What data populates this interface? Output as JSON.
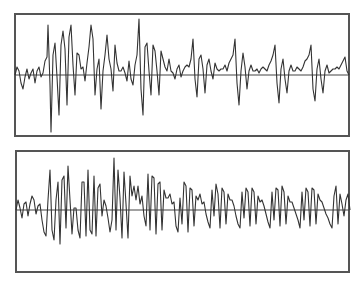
{
  "chart_data": [
    {
      "type": "line",
      "title": "",
      "xlabel": "",
      "ylabel": "",
      "grid": false,
      "legend": null,
      "description": "Waveform trace (top panel) with horizontal zero baseline; large bursts early that decay, recurring smaller bursts toward the right",
      "frame": {
        "x": 14,
        "y": 13,
        "w": 336,
        "h": 124
      },
      "baseline_y": 75,
      "ylim": [
        -62,
        62
      ],
      "line_color": "#333333",
      "points_dx_dy": [
        [
          0,
          0
        ],
        [
          2,
          -8
        ],
        [
          4,
          -4
        ],
        [
          6,
          8
        ],
        [
          8,
          14
        ],
        [
          10,
          2
        ],
        [
          12,
          -6
        ],
        [
          14,
          4
        ],
        [
          16,
          -2
        ],
        [
          18,
          -6
        ],
        [
          20,
          8
        ],
        [
          22,
          -4
        ],
        [
          24,
          -8
        ],
        [
          26,
          2
        ],
        [
          28,
          -2
        ],
        [
          30,
          -14
        ],
        [
          32,
          -18
        ],
        [
          33,
          -50
        ],
        [
          35,
          10
        ],
        [
          36,
          57
        ],
        [
          38,
          -20
        ],
        [
          40,
          -32
        ],
        [
          42,
          2
        ],
        [
          44,
          40
        ],
        [
          46,
          -30
        ],
        [
          48,
          -44
        ],
        [
          50,
          -26
        ],
        [
          52,
          30
        ],
        [
          54,
          -38
        ],
        [
          56,
          -50
        ],
        [
          58,
          -10
        ],
        [
          60,
          20
        ],
        [
          62,
          -22
        ],
        [
          64,
          -20
        ],
        [
          66,
          -6
        ],
        [
          68,
          -8
        ],
        [
          70,
          6
        ],
        [
          72,
          -12
        ],
        [
          74,
          -28
        ],
        [
          76,
          -50
        ],
        [
          78,
          -36
        ],
        [
          80,
          20
        ],
        [
          82,
          -6
        ],
        [
          84,
          -16
        ],
        [
          86,
          34
        ],
        [
          88,
          -4
        ],
        [
          90,
          -20
        ],
        [
          92,
          -40
        ],
        [
          94,
          -16
        ],
        [
          96,
          -6
        ],
        [
          98,
          16
        ],
        [
          100,
          -30
        ],
        [
          102,
          -12
        ],
        [
          104,
          -4
        ],
        [
          106,
          -4
        ],
        [
          108,
          -8
        ],
        [
          110,
          -2
        ],
        [
          112,
          6
        ],
        [
          114,
          -14
        ],
        [
          116,
          4
        ],
        [
          118,
          10
        ],
        [
          120,
          -10
        ],
        [
          122,
          -20
        ],
        [
          124,
          -56
        ],
        [
          126,
          14
        ],
        [
          128,
          40
        ],
        [
          130,
          -28
        ],
        [
          132,
          -32
        ],
        [
          134,
          -4
        ],
        [
          136,
          20
        ],
        [
          138,
          -30
        ],
        [
          140,
          -24
        ],
        [
          142,
          -4
        ],
        [
          144,
          20
        ],
        [
          146,
          -24
        ],
        [
          148,
          -16
        ],
        [
          150,
          -8
        ],
        [
          152,
          -4
        ],
        [
          154,
          -16
        ],
        [
          156,
          -4
        ],
        [
          158,
          -2
        ],
        [
          160,
          4
        ],
        [
          162,
          -6
        ],
        [
          164,
          -10
        ],
        [
          166,
          2
        ],
        [
          168,
          -4
        ],
        [
          170,
          -8
        ],
        [
          172,
          -10
        ],
        [
          174,
          -8
        ],
        [
          176,
          -16
        ],
        [
          178,
          -36
        ],
        [
          180,
          4
        ],
        [
          182,
          22
        ],
        [
          184,
          -16
        ],
        [
          186,
          -20
        ],
        [
          188,
          -6
        ],
        [
          190,
          18
        ],
        [
          192,
          -10
        ],
        [
          194,
          -16
        ],
        [
          196,
          -4
        ],
        [
          198,
          4
        ],
        [
          200,
          -12
        ],
        [
          202,
          -6
        ],
        [
          204,
          -4
        ],
        [
          206,
          -6
        ],
        [
          208,
          -6
        ],
        [
          210,
          -10
        ],
        [
          212,
          -4
        ],
        [
          214,
          -12
        ],
        [
          216,
          -16
        ],
        [
          218,
          -20
        ],
        [
          220,
          -36
        ],
        [
          222,
          8
        ],
        [
          224,
          30
        ],
        [
          226,
          -4
        ],
        [
          228,
          -22
        ],
        [
          230,
          -8
        ],
        [
          232,
          14
        ],
        [
          234,
          -4
        ],
        [
          236,
          -10
        ],
        [
          238,
          -4
        ],
        [
          240,
          -4
        ],
        [
          242,
          -6
        ],
        [
          244,
          -2
        ],
        [
          246,
          -6
        ],
        [
          248,
          -8
        ],
        [
          250,
          -6
        ],
        [
          252,
          -4
        ],
        [
          254,
          -10
        ],
        [
          256,
          -14
        ],
        [
          258,
          -20
        ],
        [
          260,
          -30
        ],
        [
          262,
          8
        ],
        [
          264,
          28
        ],
        [
          266,
          -6
        ],
        [
          268,
          -16
        ],
        [
          270,
          4
        ],
        [
          272,
          18
        ],
        [
          274,
          -4
        ],
        [
          276,
          -10
        ],
        [
          278,
          -4
        ],
        [
          280,
          -4
        ],
        [
          282,
          -8
        ],
        [
          284,
          -6
        ],
        [
          286,
          -4
        ],
        [
          288,
          -8
        ],
        [
          290,
          -14
        ],
        [
          292,
          -16
        ],
        [
          294,
          -20
        ],
        [
          296,
          -30
        ],
        [
          298,
          14
        ],
        [
          300,
          26
        ],
        [
          302,
          -6
        ],
        [
          304,
          -16
        ],
        [
          306,
          4
        ],
        [
          308,
          18
        ],
        [
          310,
          -4
        ],
        [
          312,
          -10
        ],
        [
          314,
          -2
        ],
        [
          316,
          -4
        ],
        [
          318,
          -6
        ],
        [
          320,
          -6
        ],
        [
          322,
          -8
        ],
        [
          324,
          -6
        ],
        [
          326,
          -10
        ],
        [
          328,
          -14
        ],
        [
          330,
          -18
        ],
        [
          332,
          -4
        ],
        [
          334,
          0
        ]
      ]
    },
    {
      "type": "line",
      "title": "",
      "xlabel": "",
      "ylabel": "",
      "grid": false,
      "legend": null,
      "description": "Waveform trace (bottom panel) with horizontal zero baseline; dense periodic bursts with asymmetric (mostly positive) peaks and rounded negative troughs",
      "frame": {
        "x": 15,
        "y": 150,
        "w": 335,
        "h": 123
      },
      "baseline_y": 210,
      "ylim": [
        -60,
        60
      ],
      "line_color": "#333333",
      "points_dx_dy": [
        [
          0,
          0
        ],
        [
          2,
          -10
        ],
        [
          4,
          -2
        ],
        [
          6,
          8
        ],
        [
          8,
          -6
        ],
        [
          10,
          -8
        ],
        [
          12,
          6
        ],
        [
          14,
          -6
        ],
        [
          16,
          -14
        ],
        [
          18,
          -10
        ],
        [
          20,
          4
        ],
        [
          22,
          -4
        ],
        [
          24,
          -6
        ],
        [
          26,
          10
        ],
        [
          28,
          22
        ],
        [
          30,
          26
        ],
        [
          32,
          -10
        ],
        [
          34,
          -40
        ],
        [
          36,
          20
        ],
        [
          38,
          30
        ],
        [
          40,
          -10
        ],
        [
          42,
          -28
        ],
        [
          44,
          34
        ],
        [
          46,
          -30
        ],
        [
          48,
          -34
        ],
        [
          50,
          18
        ],
        [
          52,
          -44
        ],
        [
          54,
          -10
        ],
        [
          56,
          24
        ],
        [
          58,
          -2
        ],
        [
          60,
          -2
        ],
        [
          62,
          20
        ],
        [
          64,
          28
        ],
        [
          66,
          -28
        ],
        [
          68,
          -28
        ],
        [
          70,
          26
        ],
        [
          72,
          -40
        ],
        [
          74,
          20
        ],
        [
          76,
          24
        ],
        [
          78,
          -34
        ],
        [
          80,
          26
        ],
        [
          82,
          -22
        ],
        [
          84,
          -26
        ],
        [
          86,
          6
        ],
        [
          88,
          -10
        ],
        [
          90,
          -4
        ],
        [
          92,
          8
        ],
        [
          94,
          22
        ],
        [
          96,
          10
        ],
        [
          98,
          -52
        ],
        [
          100,
          20
        ],
        [
          102,
          -40
        ],
        [
          104,
          -12
        ],
        [
          106,
          28
        ],
        [
          108,
          -38
        ],
        [
          110,
          -6
        ],
        [
          112,
          28
        ],
        [
          114,
          -34
        ],
        [
          116,
          -14
        ],
        [
          118,
          -24
        ],
        [
          120,
          -10
        ],
        [
          122,
          -24
        ],
        [
          124,
          -6
        ],
        [
          126,
          -14
        ],
        [
          128,
          6
        ],
        [
          130,
          16
        ],
        [
          132,
          -36
        ],
        [
          134,
          20
        ],
        [
          136,
          -34
        ],
        [
          138,
          -32
        ],
        [
          140,
          24
        ],
        [
          142,
          -26
        ],
        [
          144,
          -28
        ],
        [
          146,
          20
        ],
        [
          148,
          -20
        ],
        [
          150,
          -12
        ],
        [
          152,
          -12
        ],
        [
          154,
          -16
        ],
        [
          156,
          -6
        ],
        [
          158,
          -8
        ],
        [
          160,
          16
        ],
        [
          162,
          22
        ],
        [
          164,
          -12
        ],
        [
          166,
          14
        ],
        [
          168,
          -28
        ],
        [
          170,
          -24
        ],
        [
          172,
          22
        ],
        [
          174,
          -22
        ],
        [
          176,
          -20
        ],
        [
          178,
          16
        ],
        [
          180,
          -14
        ],
        [
          182,
          -10
        ],
        [
          184,
          -16
        ],
        [
          186,
          -6
        ],
        [
          188,
          -8
        ],
        [
          190,
          4
        ],
        [
          192,
          12
        ],
        [
          194,
          18
        ],
        [
          196,
          -20
        ],
        [
          198,
          6
        ],
        [
          200,
          -26
        ],
        [
          202,
          -16
        ],
        [
          204,
          18
        ],
        [
          206,
          -22
        ],
        [
          208,
          -18
        ],
        [
          210,
          14
        ],
        [
          212,
          -16
        ],
        [
          214,
          -10
        ],
        [
          216,
          -10
        ],
        [
          218,
          -4
        ],
        [
          220,
          6
        ],
        [
          222,
          14
        ],
        [
          224,
          18
        ],
        [
          226,
          -18
        ],
        [
          228,
          8
        ],
        [
          230,
          -22
        ],
        [
          232,
          -18
        ],
        [
          234,
          16
        ],
        [
          236,
          -22
        ],
        [
          238,
          -18
        ],
        [
          240,
          14
        ],
        [
          242,
          -14
        ],
        [
          244,
          -8
        ],
        [
          246,
          -10
        ],
        [
          248,
          -4
        ],
        [
          250,
          4
        ],
        [
          252,
          12
        ],
        [
          254,
          18
        ],
        [
          256,
          -18
        ],
        [
          258,
          10
        ],
        [
          260,
          -22
        ],
        [
          262,
          -20
        ],
        [
          264,
          16
        ],
        [
          266,
          -24
        ],
        [
          268,
          -18
        ],
        [
          270,
          14
        ],
        [
          272,
          -14
        ],
        [
          274,
          -8
        ],
        [
          276,
          -8
        ],
        [
          278,
          -2
        ],
        [
          280,
          4
        ],
        [
          282,
          10
        ],
        [
          284,
          18
        ],
        [
          286,
          -18
        ],
        [
          288,
          10
        ],
        [
          290,
          -22
        ],
        [
          292,
          -18
        ],
        [
          294,
          16
        ],
        [
          296,
          -22
        ],
        [
          298,
          -20
        ],
        [
          300,
          14
        ],
        [
          302,
          -16
        ],
        [
          304,
          -10
        ],
        [
          306,
          -8
        ],
        [
          308,
          -2
        ],
        [
          310,
          4
        ],
        [
          312,
          8
        ],
        [
          314,
          14
        ],
        [
          316,
          18
        ],
        [
          318,
          -14
        ],
        [
          320,
          -24
        ],
        [
          322,
          14
        ],
        [
          324,
          -16
        ],
        [
          326,
          -6
        ],
        [
          328,
          6
        ],
        [
          330,
          -10
        ],
        [
          332,
          -16
        ],
        [
          334,
          0
        ]
      ]
    }
  ]
}
